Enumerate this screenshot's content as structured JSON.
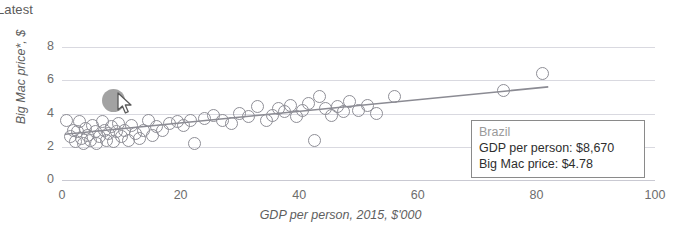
{
  "header": {
    "latest_label": "Latest"
  },
  "chart_data": {
    "type": "scatter",
    "title": "",
    "xlabel": "GDP per person, 2015, $'000",
    "ylabel": "Big Mac price*, $",
    "xlim": [
      0,
      100
    ],
    "ylim": [
      0,
      8
    ],
    "xticks": [
      "0",
      "20",
      "40",
      "60",
      "80",
      "100"
    ],
    "xtick_values": [
      0,
      20,
      40,
      60,
      80,
      100
    ],
    "yticks": [
      "0",
      "2",
      "4",
      "6",
      "8"
    ],
    "ytick_values": [
      0,
      2,
      4,
      6,
      8
    ],
    "grid": true,
    "legend": false,
    "series": [
      {
        "name": "Countries",
        "marker": "open-circle",
        "color": "#8e8e96",
        "points": [
          [
            0.8,
            3.6
          ],
          [
            1.4,
            2.6
          ],
          [
            1.9,
            3.0
          ],
          [
            2.2,
            2.3
          ],
          [
            2.6,
            2.9
          ],
          [
            3.0,
            3.5
          ],
          [
            3.3,
            2.5
          ],
          [
            3.6,
            2.2
          ],
          [
            4.0,
            3.1
          ],
          [
            4.3,
            2.7
          ],
          [
            4.8,
            2.4
          ],
          [
            5.2,
            3.3
          ],
          [
            5.6,
            2.9
          ],
          [
            5.9,
            2.2
          ],
          [
            6.3,
            2.6
          ],
          [
            6.8,
            3.5
          ],
          [
            7.1,
            3.0
          ],
          [
            7.5,
            2.4
          ],
          [
            7.9,
            2.8
          ],
          [
            8.3,
            3.2
          ],
          [
            8.7,
            2.3
          ],
          [
            9.2,
            2.9
          ],
          [
            9.6,
            3.4
          ],
          [
            10.1,
            2.6
          ],
          [
            10.6,
            3.0
          ],
          [
            11.2,
            2.4
          ],
          [
            11.8,
            3.3
          ],
          [
            12.4,
            2.8
          ],
          [
            13.1,
            2.5
          ],
          [
            13.8,
            3.0
          ],
          [
            14.6,
            3.6
          ],
          [
            15.2,
            2.7
          ],
          [
            16.0,
            3.2
          ],
          [
            17.0,
            3.0
          ],
          [
            18.2,
            3.4
          ],
          [
            19.4,
            3.5
          ],
          [
            20.5,
            3.3
          ],
          [
            21.6,
            3.6
          ],
          [
            22.4,
            2.2
          ],
          [
            24.0,
            3.7
          ],
          [
            25.5,
            3.9
          ],
          [
            27.0,
            3.6
          ],
          [
            28.5,
            3.4
          ],
          [
            30.0,
            4.0
          ],
          [
            31.5,
            3.8
          ],
          [
            33.0,
            4.4
          ],
          [
            34.5,
            3.6
          ],
          [
            35.5,
            3.9
          ],
          [
            36.5,
            4.3
          ],
          [
            37.5,
            4.1
          ],
          [
            38.5,
            4.5
          ],
          [
            39.5,
            3.8
          ],
          [
            40.5,
            4.2
          ],
          [
            41.5,
            4.6
          ],
          [
            42.5,
            2.4
          ],
          [
            43.5,
            5.0
          ],
          [
            44.5,
            4.3
          ],
          [
            45.5,
            3.9
          ],
          [
            46.5,
            4.4
          ],
          [
            47.5,
            4.1
          ],
          [
            48.5,
            4.7
          ],
          [
            50.0,
            4.2
          ],
          [
            51.5,
            4.5
          ],
          [
            53.0,
            4.0
          ],
          [
            56.0,
            5.0
          ],
          [
            74.5,
            5.4
          ],
          [
            81.0,
            6.4
          ]
        ]
      }
    ],
    "highlighted_point": {
      "name": "Brazil",
      "x": 8.67,
      "y": 4.78,
      "color": "#9a9a9a",
      "marker": "filled-circle"
    },
    "trendline": {
      "visible": true,
      "color": "#8b8b93",
      "x_start": 0.5,
      "y_start": 2.75,
      "x_end": 82.0,
      "y_end": 5.6
    }
  },
  "tooltip": {
    "title": "Brazil",
    "rows": [
      "GDP per person: $8,670",
      "Big Mac price: $4.78"
    ]
  }
}
